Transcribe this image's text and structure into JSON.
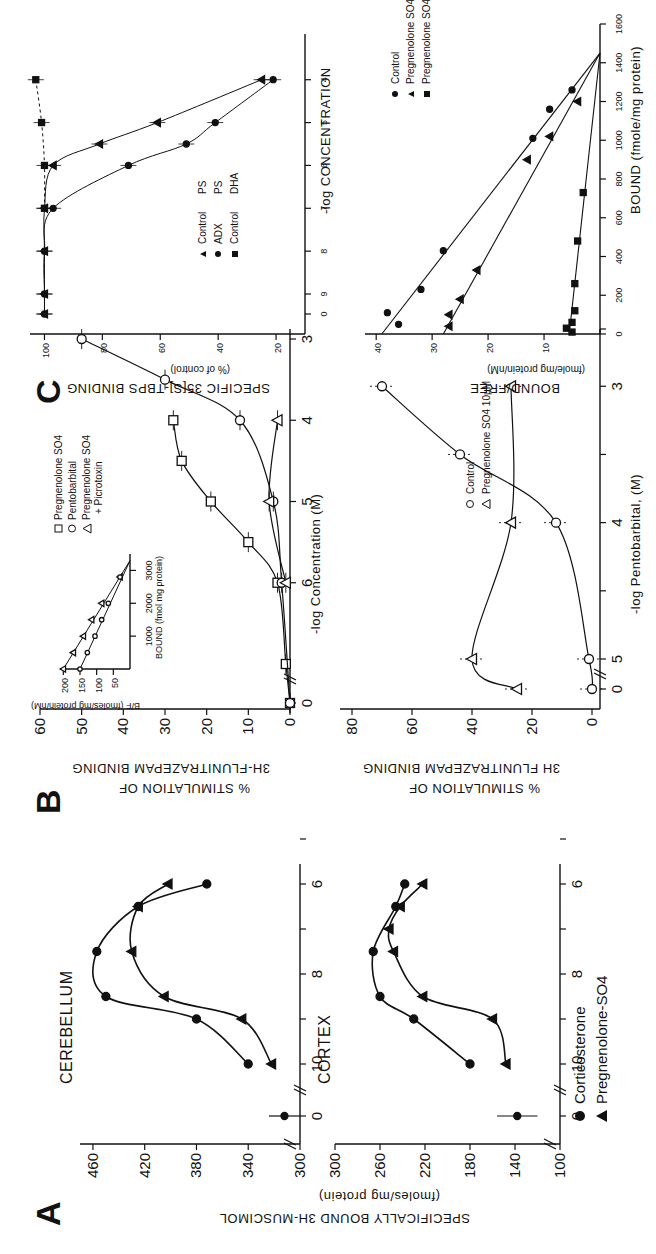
{
  "figure": {
    "panels": [
      "A",
      "B",
      "C"
    ]
  },
  "panelA": {
    "letter": "A",
    "ylabel": "SPECIFICALLY BOUND 3H-MUSCIMOL",
    "yunit": "(fmoles/mg protein)",
    "legend": [
      {
        "marker": "filled-circle",
        "label": "Corticosterone"
      },
      {
        "marker": "filled-triangle",
        "label": "Pregnenolone-SO4"
      }
    ],
    "cerebellum": {
      "title": "CEREBELLUM",
      "yticks": [
        "460",
        "420",
        "380",
        "340",
        "300"
      ]
    },
    "cortex": {
      "title": "CORTEX",
      "yticks": [
        "300",
        "260",
        "220",
        "180",
        "140",
        "100"
      ]
    },
    "xticks": [
      "0",
      "10",
      "8",
      "6"
    ]
  },
  "panelB": {
    "letter": "B",
    "top": {
      "ylabel1": "% STIMULATION OF",
      "ylabel2": "3H-FLUNITRAZEPAM BINDING",
      "xlabel": "-log  Concentration  (M)",
      "yticks": [
        "60",
        "50",
        "40",
        "30",
        "20",
        "10",
        "0"
      ],
      "xticks": [
        "0",
        "6",
        "5",
        "4",
        "3"
      ],
      "legend": [
        {
          "marker": "open-square",
          "label": "Pregnenolone SO4"
        },
        {
          "marker": "open-circle",
          "label": "Pentobarbital"
        },
        {
          "marker": "open-triangle",
          "label": "Pregnenolone SO4"
        },
        {
          "marker": "",
          "label": "+ Picrotoxin"
        }
      ],
      "inset": {
        "ylabel": "B/F (fmoles/mg protein/nM)",
        "xlabel": "BOUND (fmol mg protein)",
        "yticks": [
          "200",
          "150",
          "100",
          "50"
        ],
        "xticks": [
          "1000",
          "2000",
          "3000"
        ]
      }
    },
    "bottom": {
      "ylabel1": "% STIMULATION OF",
      "ylabel2": "3H  FLUNITRAZEPAM BINDING",
      "xlabel": "-log  Pentobarbital,  (M)",
      "yticks": [
        "80",
        "60",
        "40",
        "20",
        "0"
      ],
      "xticks": [
        "0",
        "5",
        "4",
        "3"
      ],
      "legend": [
        {
          "marker": "open-circle",
          "label": "Control"
        },
        {
          "marker": "open-triangle",
          "label": "Pregnenolone SO4  10µM"
        }
      ]
    }
  },
  "panelC": {
    "letter": "C",
    "top": {
      "ylabel1": "SPECIFIC 35[S]-TBPS BINDING",
      "ylabel2": "(% of control)",
      "xlabel": "-log CONCENTRATION",
      "yticks": [
        "100",
        "80",
        "60",
        "40",
        "20"
      ],
      "xticks": [
        "0",
        "9",
        "8",
        "7",
        "6",
        "5",
        "4"
      ],
      "legend": [
        {
          "marker": "filled-triangle",
          "label": "Control",
          "drug": "PS"
        },
        {
          "marker": "filled-circle",
          "label": "ADX",
          "drug": "PS"
        },
        {
          "marker": "filled-square",
          "label": "Control",
          "drug": "DHA"
        }
      ]
    },
    "bottom": {
      "ylabel1": "BOUND/FREE",
      "ylabel2": "(fmole/mg protein/nM)",
      "xlabel": "BOUND (fmole/mg protein)",
      "yticks": [
        "40",
        "30",
        "20",
        "10"
      ],
      "xticks": [
        "0",
        "200",
        "400",
        "600",
        "800",
        "1000",
        "1200",
        "1400",
        "1600"
      ],
      "legend": [
        {
          "marker": "filled-circle",
          "label": "Control"
        },
        {
          "marker": "filled-triangle",
          "label": "Pregnenolone SO4  (10µM)"
        },
        {
          "marker": "filled-square",
          "label": "Pregnenolone SO4  (100µM)"
        }
      ]
    }
  },
  "chart_data": [
    {
      "id": "A-cerebellum",
      "type": "line",
      "title": "CEREBELLUM",
      "xlabel": "-log concentration (M)",
      "ylabel": "Specifically bound 3H-muscimol (fmoles/mg protein)",
      "ylim": [
        300,
        470
      ],
      "x_note": "x=0 is control (no steroid), axis break between 0 and 10",
      "series": [
        {
          "name": "Corticosterone",
          "marker": "filled-circle",
          "control": {
            "x": 0,
            "y": 312,
            "err": 12
          },
          "x": [
            10,
            9,
            8.5,
            7.5,
            6.5,
            6
          ],
          "y": [
            340,
            380,
            450,
            457,
            425,
            372
          ]
        },
        {
          "name": "Pregnenolone-SO4",
          "marker": "filled-triangle",
          "x": [
            10,
            9,
            8.5,
            7.5,
            6.5,
            6
          ],
          "y": [
            322,
            345,
            405,
            430,
            425,
            402
          ]
        }
      ]
    },
    {
      "id": "A-cortex",
      "type": "line",
      "title": "CORTEX",
      "xlabel": "-log concentration (M)",
      "ylabel": "Specifically bound 3H-muscimol (fmoles/mg protein)",
      "ylim": [
        100,
        300
      ],
      "series": [
        {
          "name": "Corticosterone",
          "marker": "filled-circle",
          "control": {
            "x": 0,
            "y": 138,
            "err": 18
          },
          "x": [
            10,
            9,
            8.5,
            7.5,
            6.5,
            6
          ],
          "y": [
            180,
            230,
            260,
            266,
            246,
            238
          ]
        },
        {
          "name": "Pregnenolone-SO4",
          "marker": "filled-triangle",
          "x": [
            10,
            9,
            8.5,
            7.5,
            7,
            6.5,
            6
          ],
          "y": [
            148,
            160,
            222,
            248,
            252,
            242,
            222
          ]
        }
      ]
    },
    {
      "id": "B-top",
      "type": "line",
      "xlabel": "-log Concentration (M)",
      "ylabel": "% Stimulation of 3H-flunitrazepam binding",
      "ylim": [
        0,
        60
      ],
      "series": [
        {
          "name": "Pregnenolone SO4",
          "marker": "open-square",
          "x": [
            0,
            7,
            6,
            5.5,
            5,
            4.5,
            4
          ],
          "y": [
            0,
            1,
            3,
            10,
            19,
            26,
            28
          ]
        },
        {
          "name": "Pentobarbital",
          "marker": "open-circle",
          "x": [
            0,
            6,
            5,
            4,
            3.5,
            3
          ],
          "y": [
            0,
            2,
            4,
            12,
            30,
            50
          ]
        },
        {
          "name": "Pregnenolone SO4 + Picrotoxin",
          "marker": "open-triangle",
          "x": [
            6,
            5,
            4
          ],
          "y": [
            1,
            5,
            3
          ]
        }
      ],
      "inset": {
        "type": "scatter",
        "xlabel": "BOUND (fmol mg protein)",
        "ylabel": "B/F (fmoles/mg protein/nM)",
        "xlim": [
          0,
          3500
        ],
        "ylim": [
          0,
          200
        ],
        "series": [
          {
            "name": "upper line",
            "x": [
              0,
              500,
              1000,
              1500,
              2000,
              2800
            ],
            "y": [
              200,
              170,
              140,
              115,
              85,
              30
            ]
          },
          {
            "name": "lower line",
            "x": [
              0,
              500,
              1000,
              1500,
              2000,
              2800
            ],
            "y": [
              150,
              128,
              105,
              85,
              65,
              30
            ]
          }
        ]
      }
    },
    {
      "id": "B-bottom",
      "type": "line",
      "xlabel": "-log Pentobarbital (M)",
      "ylabel": "% Stimulation of 3H-flunitrazepam binding",
      "ylim": [
        0,
        80
      ],
      "series": [
        {
          "name": "Control",
          "marker": "open-circle",
          "x": [
            0,
            5,
            4,
            3.5,
            3
          ],
          "y": [
            0,
            1,
            12,
            44,
            70
          ]
        },
        {
          "name": "Pregnenolone SO4 10µM",
          "marker": "open-triangle",
          "x": [
            0,
            5,
            4,
            3
          ],
          "y": [
            25,
            40,
            27,
            27
          ]
        }
      ]
    },
    {
      "id": "C-top",
      "type": "line",
      "xlabel": "-log CONCENTRATION",
      "ylabel": "Specific 35[S]-TBPS binding (% of control)",
      "ylim": [
        10,
        105
      ],
      "series": [
        {
          "name": "Control PS",
          "marker": "filled-triangle",
          "x": [
            0,
            9,
            8,
            7,
            6,
            5.5,
            5,
            4
          ],
          "y": [
            100,
            100,
            100,
            100,
            97,
            81,
            61,
            25
          ]
        },
        {
          "name": "ADX PS",
          "marker": "filled-circle",
          "x": [
            0,
            9,
            8,
            7,
            6,
            5.5,
            5,
            4
          ],
          "y": [
            100,
            100,
            100,
            97,
            71,
            51,
            41,
            21
          ]
        },
        {
          "name": "Control DHA",
          "marker": "filled-square",
          "dashed": true,
          "x": [
            7,
            6,
            5,
            4
          ],
          "y": [
            100,
            100,
            101,
            103
          ]
        }
      ]
    },
    {
      "id": "C-bottom",
      "type": "scatter",
      "xlabel": "BOUND (fmole/mg protein)",
      "ylabel": "BOUND/FREE (fmole/mg protein/nM)",
      "xlim": [
        0,
        1600
      ],
      "ylim": [
        0,
        42
      ],
      "series": [
        {
          "name": "Control",
          "marker": "filled-circle",
          "x": [
            50,
            110,
            230,
            430,
            1010,
            1160,
            1260
          ],
          "y": [
            36,
            38,
            32,
            28,
            12,
            9,
            5
          ]
        },
        {
          "name": "Pregnenolone SO4 (10µM)",
          "marker": "filled-triangle",
          "x": [
            40,
            100,
            180,
            330,
            900,
            1020,
            1200
          ],
          "y": [
            27,
            27,
            25,
            22,
            13,
            9,
            4
          ]
        },
        {
          "name": "Pregnenolone SO4 (100µM)",
          "marker": "filled-square",
          "x": [
            10,
            30,
            60,
            120,
            260,
            480,
            730
          ],
          "y": [
            5,
            6,
            5,
            4.5,
            4.5,
            4,
            3
          ]
        }
      ],
      "fit_lines": [
        {
          "series": "Control",
          "from": [
            0,
            39
          ],
          "to": [
            1450,
            0
          ]
        },
        {
          "series": "Pregnenolone SO4 (10µM)",
          "from": [
            0,
            28
          ],
          "to": [
            1450,
            0
          ]
        },
        {
          "series": "Pregnenolone SO4 (100µM)",
          "from": [
            0,
            5.5
          ],
          "to": [
            1450,
            0
          ]
        }
      ]
    }
  ]
}
